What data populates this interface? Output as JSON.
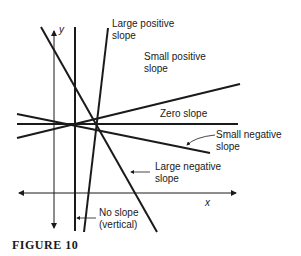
{
  "figure": {
    "caption": "FIGURE 10",
    "axes": {
      "x_label": "x",
      "y_label": "y"
    },
    "lines": [
      {
        "id": "large-positive",
        "label_line1": "Large positive",
        "label_line2": "slope"
      },
      {
        "id": "small-positive",
        "label_line1": "Small positive",
        "label_line2": "slope"
      },
      {
        "id": "zero",
        "label_line1": "Zero slope"
      },
      {
        "id": "small-negative",
        "label_line1": "Small negative",
        "label_line2": "slope"
      },
      {
        "id": "large-negative",
        "label_line1": "Large negative",
        "label_line2": "slope"
      },
      {
        "id": "vertical",
        "label_line1": "No slope",
        "label_line2": "(vertical)"
      }
    ],
    "colors": {
      "ink": "#1a1a1a",
      "background": "#ffffff"
    }
  }
}
